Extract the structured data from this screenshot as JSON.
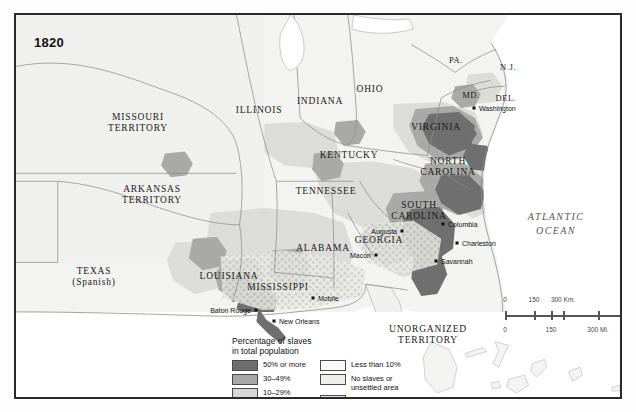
{
  "map": {
    "year": "1820",
    "ocean_label": "ATLANTIC\nOCEAN",
    "ocean_line1": "ATLANTIC",
    "ocean_line2": "OCEAN",
    "states": [
      {
        "name": "MISSOURI\nTERRITORY",
        "l1": "MISSOURI",
        "l2": "TERRITORY",
        "x": 122,
        "y": 108
      },
      {
        "name": "ARKANSAS\nTERRITORY",
        "l1": "ARKANSAS",
        "l2": "TERRITORY",
        "x": 136,
        "y": 180
      },
      {
        "name": "TEXAS\n(Spanish)",
        "l1": "TEXAS",
        "l2": "(Spanish)",
        "x": 78,
        "y": 262
      },
      {
        "name": "ILLINOIS",
        "l1": "ILLINOIS",
        "l2": "",
        "x": 243,
        "y": 95
      },
      {
        "name": "INDIANA",
        "l1": "INDIANA",
        "l2": "",
        "x": 304,
        "y": 86
      },
      {
        "name": "OHIO",
        "l1": "OHIO",
        "l2": "",
        "x": 354,
        "y": 74
      },
      {
        "name": "KENTUCKY",
        "l1": "KENTUCKY",
        "l2": "",
        "x": 333,
        "y": 140
      },
      {
        "name": "TENNESSEE",
        "l1": "TENNESSEE",
        "l2": "",
        "x": 310,
        "y": 176
      },
      {
        "name": "MISSISSIPPI",
        "l1": "MISSISSIPPI",
        "l2": "",
        "x": 262,
        "y": 272
      },
      {
        "name": "ALABAMA",
        "l1": "ALABAMA",
        "l2": "",
        "x": 307,
        "y": 233
      },
      {
        "name": "LOUISIANA",
        "l1": "LOUISIANA",
        "l2": "",
        "x": 213,
        "y": 261
      },
      {
        "name": "GEORGIA",
        "l1": "GEORGIA",
        "l2": "",
        "x": 363,
        "y": 225
      },
      {
        "name": "SOUTH\nCAROLINA",
        "l1": "SOUTH",
        "l2": "CAROLINA",
        "x": 403,
        "y": 196
      },
      {
        "name": "NORTH\nCAROLINA",
        "l1": "NORTH",
        "l2": "CAROLINA",
        "x": 432,
        "y": 152
      },
      {
        "name": "VIRGINIA",
        "l1": "VIRGINIA",
        "l2": "",
        "x": 420,
        "y": 112
      },
      {
        "name": "UNORGANIZED\nTERRITORY",
        "l1": "UNORGANIZED",
        "l2": "TERRITORY",
        "x": 412,
        "y": 320
      }
    ],
    "small_states": [
      {
        "name": "PA.",
        "x": 440,
        "y": 45
      },
      {
        "name": "N.J.",
        "x": 492,
        "y": 52
      },
      {
        "name": "MD.",
        "x": 455,
        "y": 80
      },
      {
        "name": "DEL.",
        "x": 490,
        "y": 83
      }
    ],
    "cities": [
      {
        "name": "Washington",
        "x": 458,
        "y": 93,
        "align": "left",
        "dx": 5,
        "dy": 0
      },
      {
        "name": "Columbia",
        "x": 427,
        "y": 209,
        "align": "left",
        "dx": 5,
        "dy": 0
      },
      {
        "name": "Augusta",
        "x": 386,
        "y": 216,
        "align": "right",
        "dx": -5,
        "dy": 0
      },
      {
        "name": "Charleston",
        "x": 441,
        "y": 228,
        "align": "left",
        "dx": 5,
        "dy": 0
      },
      {
        "name": "Savannah",
        "x": 420,
        "y": 246,
        "align": "left",
        "dx": 5,
        "dy": 0
      },
      {
        "name": "Macon",
        "x": 360,
        "y": 240,
        "align": "right",
        "dx": -5,
        "dy": 0
      },
      {
        "name": "Mobile",
        "x": 297,
        "y": 283,
        "align": "left",
        "dx": 5,
        "dy": 0
      },
      {
        "name": "New Orleans",
        "x": 258,
        "y": 306,
        "align": "left",
        "dx": 5,
        "dy": 0
      },
      {
        "name": "Baton Rouge",
        "x": 240,
        "y": 295,
        "align": "right",
        "dx": -5,
        "dy": 0
      }
    ]
  },
  "legend": {
    "title_line1": "Percentage of slaves",
    "title_line2": "in total population",
    "left_items": [
      {
        "label": "50% or more",
        "color": "#6e6e6e"
      },
      {
        "label": "30–49%",
        "color": "#a8a8a8"
      },
      {
        "label": "10–29%",
        "color": "#d8d8d6"
      }
    ],
    "right_items": [
      {
        "label_line1": "Less than 10%",
        "label_line2": "",
        "color": "#fbfbf9",
        "pattern": false
      },
      {
        "label_line1": "No slaves or",
        "label_line2": "unsettled area",
        "color": "#eeeeec",
        "pattern": false
      },
      {
        "label_line1": "Area of cotton",
        "label_line2": "production",
        "color": "#e6e6e2",
        "pattern": true
      }
    ]
  },
  "scale": {
    "km_labels": [
      "0",
      "150",
      "300 Km."
    ],
    "mi_labels": [
      "0",
      "150",
      "300 Mi."
    ]
  },
  "colors": {
    "shade_50plus": "#6e6e6e",
    "shade_30_49": "#a8a8a8",
    "shade_10_29": "#d8d8d6",
    "shade_under10": "#fbfbf9",
    "unsettled": "#eeeeec",
    "water": "#ffffff",
    "frame": "#2a2a2a"
  }
}
